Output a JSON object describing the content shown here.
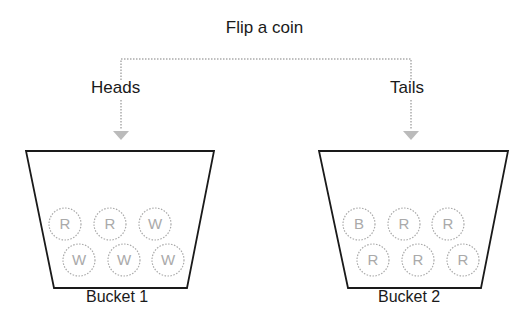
{
  "title": "Flip a coin",
  "branches": [
    {
      "label": "Heads",
      "bucket": "Bucket 1",
      "balls": [
        "R",
        "R",
        "W",
        "W",
        "W",
        "W"
      ]
    },
    {
      "label": "Tails",
      "bucket": "Bucket 2",
      "balls": [
        "B",
        "R",
        "R",
        "R",
        "R",
        "R"
      ]
    }
  ],
  "colors": {
    "line": "#1a1a1a",
    "dotted": "#9a9a9a"
  }
}
